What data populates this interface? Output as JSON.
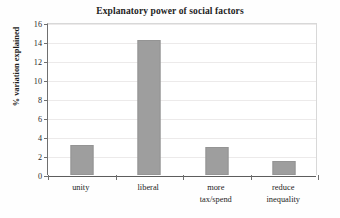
{
  "chart_data": {
    "type": "bar",
    "title": "Explanatory power of social factors",
    "xlabel": "",
    "ylabel": "% variation explained",
    "categories": [
      "unity",
      "liberal",
      "more tax/spend",
      "reduce inequality"
    ],
    "category_lines": [
      [
        "unity"
      ],
      [
        "liberal"
      ],
      [
        "more",
        "tax/spend"
      ],
      [
        "reduce",
        "inequality"
      ]
    ],
    "values": [
      3.2,
      14.2,
      2.9,
      1.45
    ],
    "ylim": [
      0,
      16
    ],
    "ytick_values": [
      0,
      2,
      4,
      6,
      8,
      10,
      12,
      14,
      16
    ],
    "ytick_labels": [
      "0",
      "2",
      "4",
      "6",
      "8",
      "10",
      "12",
      "14",
      "16"
    ],
    "grid": true,
    "legend": false,
    "bar_color": "#9e9e9e",
    "axis_color": "#6f6f6f",
    "grid_color": "#eceaea"
  }
}
